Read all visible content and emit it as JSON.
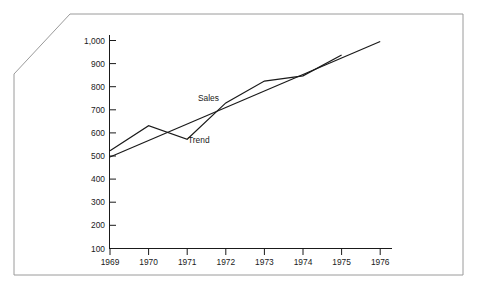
{
  "chart_data": {
    "type": "line",
    "title": "",
    "subtitle": "",
    "xlabel": "",
    "ylabel": "",
    "x": [
      1969,
      1970,
      1971,
      1972,
      1973,
      1974,
      1975,
      1976
    ],
    "xtick_labels": [
      "1969",
      "1970",
      "1971",
      "1972",
      "1973",
      "1974",
      "1975",
      "1976"
    ],
    "ytick_labels": [
      "100",
      "200",
      "300",
      "400",
      "500",
      "600",
      "700",
      "800",
      "900",
      "1,000"
    ],
    "ytick_values": [
      100,
      200,
      300,
      400,
      500,
      600,
      700,
      800,
      900,
      1000
    ],
    "ylim": [
      0,
      1000
    ],
    "xlim": [
      1969,
      1976
    ],
    "grid": false,
    "legend_position": "inline-on-series",
    "series": [
      {
        "name": "Sales",
        "label": "Sales",
        "color": "#1a1a1a",
        "x": [
          1969,
          1970,
          1971,
          1972,
          1973,
          1974,
          1975
        ],
        "values": [
          470,
          590,
          525,
          700,
          805,
          830,
          930
        ]
      },
      {
        "name": "Trend",
        "label": "Trend",
        "color": "#1a1a1a",
        "x": [
          1969,
          1976
        ],
        "values": [
          440,
          995
        ]
      }
    ],
    "annotations": [
      {
        "text": "Sales",
        "x": 1971.55,
        "y": 710
      },
      {
        "text": "Trend",
        "x": 1971.3,
        "y": 505
      }
    ]
  },
  "frame": {
    "border_color": "#9a9a9a",
    "axis_color": "#1a1a1a",
    "background": "#ffffff"
  }
}
